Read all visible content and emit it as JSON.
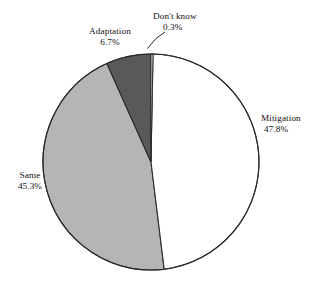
{
  "chart_data": {
    "type": "pie",
    "title": "",
    "subtitle": "",
    "xlabel": "",
    "ylabel": "",
    "legend_position": "none",
    "grid": false,
    "start_angle_deg": 90,
    "direction": "clockwise",
    "units": "percent",
    "total": 100.1,
    "categories": [
      "Don't know",
      "Mitigation",
      "Same",
      "Adaptation"
    ],
    "values": [
      0.3,
      47.8,
      45.3,
      6.7
    ],
    "slices": [
      {
        "label": "Don't know",
        "value": 0.3,
        "value_text": "0.3%",
        "color": "#ffffff",
        "label_position": "outside-top",
        "leader_line": true
      },
      {
        "label": "Mitigation",
        "value": 47.8,
        "value_text": "47.8%",
        "color": "#ffffff",
        "label_position": "outside-right",
        "leader_line": false
      },
      {
        "label": "Same",
        "value": 45.3,
        "value_text": "45.3%",
        "color": "#b5b5b5",
        "label_position": "outside-left",
        "leader_line": false
      },
      {
        "label": "Adaptation",
        "value": 6.7,
        "value_text": "6.7%",
        "color": "#595959",
        "label_position": "outside-top-left",
        "leader_line": false
      }
    ]
  },
  "labels": {
    "dontknow": {
      "name": "Don't know",
      "pct": "0.3%"
    },
    "mitigation": {
      "name": "Mitigation",
      "pct": "47.8%"
    },
    "same": {
      "name": "Same",
      "pct": "45.3%"
    },
    "adaptation": {
      "name": "Adaptation",
      "pct": "6.7%"
    }
  },
  "style": {
    "background": "#ffffff",
    "outline_color": "#2b2b2b",
    "text_color": "#111111"
  }
}
